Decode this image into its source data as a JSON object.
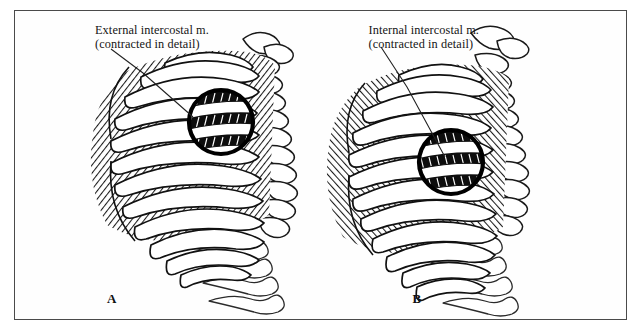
{
  "figure": {
    "border_color": "#4a4a4a",
    "background": "#ffffff",
    "ink_color": "#111111"
  },
  "panels": [
    {
      "letter": "A",
      "callout_line1": "External intercostal m.",
      "callout_line2": "(contracted in detail)",
      "subject": "posterolateral thoracic cage with external intercostal muscles",
      "detail_circle": "magnified-detail-external-intercostal"
    },
    {
      "letter": "B",
      "callout_line1": "Internal intercostal m.",
      "callout_line2": "(contracted in detail)",
      "subject": "posterolateral thoracic cage with internal intercostal muscles",
      "detail_circle": "magnified-detail-internal-intercostal"
    }
  ]
}
